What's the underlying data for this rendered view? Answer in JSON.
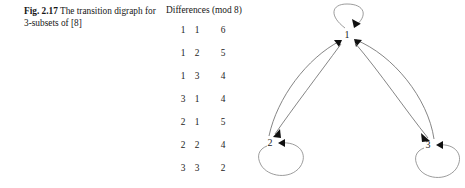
{
  "caption": {
    "figure_label": "Fig. 2.17",
    "text": "The transition digraph for 3-subsets of [8]"
  },
  "table": {
    "header": "Differences (mod 8)",
    "columns": [
      "a",
      "b",
      "difference"
    ],
    "rows": [
      {
        "a": "1",
        "b": "1",
        "d": "6"
      },
      {
        "a": "1",
        "b": "2",
        "d": "5"
      },
      {
        "a": "1",
        "b": "3",
        "d": "4"
      },
      {
        "a": "3",
        "b": "1",
        "d": "4"
      },
      {
        "a": "2",
        "b": "1",
        "d": "5"
      },
      {
        "a": "2",
        "b": "2",
        "d": "4"
      },
      {
        "a": "3",
        "b": "3",
        "d": "2"
      }
    ]
  },
  "digraph": {
    "nodes": [
      {
        "id": "1",
        "label": "1",
        "x": 92,
        "y": 35
      },
      {
        "id": "2",
        "label": "2",
        "x": 15,
        "y": 143
      },
      {
        "id": "3",
        "label": "3",
        "x": 173,
        "y": 145
      }
    ],
    "edges": [
      {
        "from": "1",
        "to": "1",
        "kind": "self-loop"
      },
      {
        "from": "2",
        "to": "2",
        "kind": "self-loop"
      },
      {
        "from": "3",
        "to": "3",
        "kind": "self-loop"
      },
      {
        "from": "2",
        "to": "1",
        "kind": "curve"
      },
      {
        "from": "1",
        "to": "2",
        "kind": "curve"
      },
      {
        "from": "3",
        "to": "1",
        "kind": "curve"
      },
      {
        "from": "1",
        "to": "3",
        "kind": "curve"
      }
    ],
    "edge_color": "#6f6f6f",
    "arrow_color": "#101010"
  }
}
